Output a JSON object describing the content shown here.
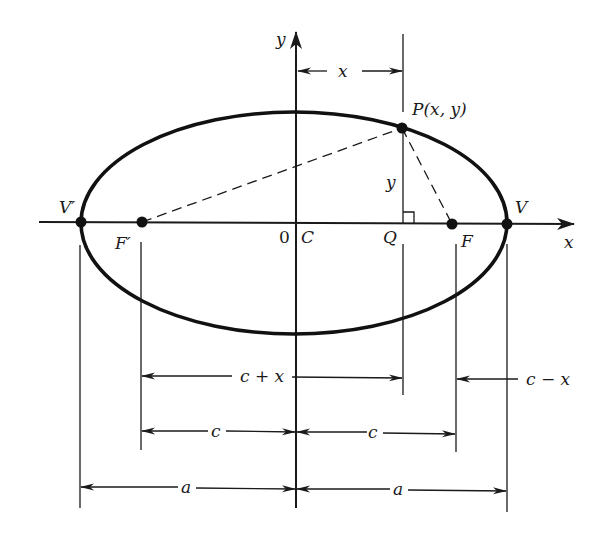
{
  "figure": {
    "labels": {
      "y_axis": "y",
      "x_axis": "x",
      "origin": "0",
      "center": "C",
      "point_p": "P(x, y)",
      "foot_q": "Q",
      "focus_right": "F",
      "focus_left": "F′",
      "vertex_right": "V",
      "vertex_left": "V′",
      "p_height": "y",
      "top_dim_x": "x",
      "dim_c_plus_x": "c + x",
      "dim_c_minus_x": "c − x",
      "dim_c_left": "c",
      "dim_c_right": "c",
      "dim_a_left": "a",
      "dim_a_right": "a"
    },
    "colors": {
      "ink": "#1a1a1a",
      "background": "#ffffff"
    }
  },
  "geometry": {
    "center": [
      296,
      223
    ],
    "semi_major_a": 213,
    "semi_minor_b": 111,
    "focal_distance_c": 155,
    "point_p": [
      402,
      128
    ],
    "foot_q": [
      402,
      223
    ],
    "focus_left": [
      142,
      222
    ],
    "focus_right": [
      452,
      224
    ],
    "vertex_left": [
      81,
      222
    ],
    "vertex_right": [
      507,
      224
    ]
  }
}
